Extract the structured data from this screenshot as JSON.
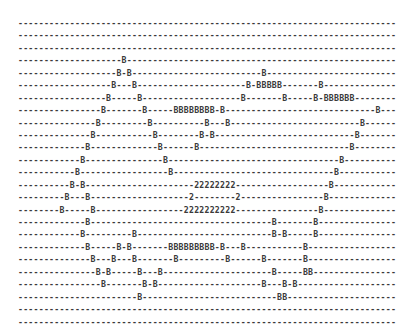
{
  "figure": {
    "kind": "ascii-art-diagram",
    "columns": 73,
    "rows": 23,
    "background_char": "-",
    "mark_chars": [
      "B",
      "2"
    ],
    "text_color": "#3a3a3a",
    "background_color": "#ffffff",
    "font_size_px": 8.2,
    "line_height_px": 12.45,
    "char_width_px": 5.18,
    "origin_x_px": 18,
    "origin_y_px": 17,
    "lines": [
      "-------------------------------------------------------------------------",
      "-------------------------------------------------------------------------",
      "-------------------------------------------------------------------------",
      "--------------------B----------------------------------------------------",
      "-------------------B-B-------------------------B-------------------------",
      "------------------B---B---------------------B-BBBBB-------B--------------",
      "-----------------B-----B-------------------B-------B-----B-BBBBBB--------",
      "----------------B-------B-----BBBBBBBB-B-----------------------------B---",
      "---------------B---------B----------B---B-------------------------B------",
      "--------------B-----------B--------B-B---------------------------B-------",
      "-------------B-------------B------B-----------------------------B--------",
      "------------B---------------B---------------------------------B----------",
      "-----------B-----------------B-------------------------------B-----------",
      "----------B-B---------------------22222222------------------B------------",
      "---------B---B-------------------2--------2----------------B-------------",
      "--------B-----B-----------------2222222222----------------B--------------",
      "-------------B-----------------------------------B-------B---------------",
      "------------B---------B--------------------------B-B-----B---------------",
      "-------------B-----B-B-------BBBBBBBBB-B---B-----------B-----------------",
      "--------------B---B---B-------B---------B------B-------B-----------------",
      "---------------B-B-----B---B---------------------B-----BB----------------",
      "----------------B-------B-B--------------------B---B-B-------------------",
      "-----------------------B--------------------------BB---------------------",
      "-------------------------------------------------------------------------",
      "-------------------------------------------------------------------------"
    ]
  }
}
